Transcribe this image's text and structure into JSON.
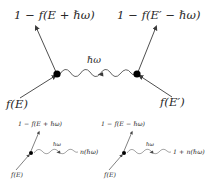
{
  "figure": {
    "type": "feynman-diagram",
    "background_color": "#ffffff",
    "line_color": "#3a3a3a",
    "vertex_color": "#000000",
    "text_color": "#262626"
  },
  "main_diagram": {
    "top_left_label": "1 − f(E + ℏω)",
    "top_right_label": "1 − f(E′ − ℏω)",
    "wave_label": "ℏω",
    "bottom_left_label": "f(E)",
    "bottom_right_label": "f(E′)",
    "left_vertex": {
      "x": 57,
      "y": 74
    },
    "right_vertex": {
      "x": 137,
      "y": 74
    }
  },
  "sub_diagram_left": {
    "top_label": "1 − f(E + ℏω)",
    "wave_label": "ℏω",
    "right_label": "n(ℏω)",
    "bottom_label": "f(E)",
    "vertex": {
      "x": 31,
      "y": 153
    }
  },
  "sub_diagram_right": {
    "top_label": "1 − f(E − ℏω)",
    "wave_label": "ℏω",
    "right_label": "1 + n(ℏω)",
    "bottom_label": "f(E)",
    "vertex": {
      "x": 124,
      "y": 153
    }
  }
}
